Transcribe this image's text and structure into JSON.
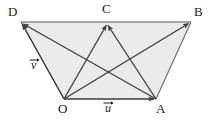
{
  "figure": {
    "type": "vector-geometry-diagram",
    "background_color": "#ffffff",
    "fill_color": "#ebebeb",
    "stroke_color": "#4a4a4a",
    "label_color": "#1a1a1a",
    "width": 211,
    "height": 121,
    "points": {
      "D": {
        "label": "D",
        "x": 21,
        "y": 22,
        "label_x": 8,
        "label_y": 6
      },
      "C": {
        "label": "C",
        "x": 107,
        "y": 23,
        "label_x": 103,
        "label_y": 3
      },
      "B": {
        "label": "B",
        "x": 191,
        "y": 22,
        "label_x": 195,
        "label_y": 6
      },
      "O": {
        "label": "O",
        "x": 64,
        "y": 99,
        "label_x": 59,
        "label_y": 103
      },
      "A": {
        "label": "A",
        "x": 156,
        "y": 99,
        "label_x": 156,
        "label_y": 103
      }
    },
    "polygon": {
      "name": "trapezoid-DBAO",
      "vertices": "D,B,A,O",
      "path": "21,22 191,22 156,99 64,99"
    },
    "vectors": [
      {
        "name": "O-to-A",
        "from": "O",
        "to": "A",
        "label": "u"
      },
      {
        "name": "O-to-D",
        "from": "O",
        "to": "D",
        "label": "v"
      },
      {
        "name": "O-to-C",
        "from": "O",
        "to": "C",
        "label": ""
      },
      {
        "name": "O-to-B",
        "from": "O",
        "to": "B",
        "label": ""
      },
      {
        "name": "A-to-D",
        "from": "A",
        "to": "D",
        "label": ""
      },
      {
        "name": "A-to-C",
        "from": "A",
        "to": "C",
        "label": ""
      }
    ],
    "vector_labels": {
      "u": {
        "text": "u",
        "x": 105,
        "y": 103
      },
      "v": {
        "text": "v",
        "x": 31,
        "y": 60
      }
    },
    "edges": [
      {
        "name": "edge-D-B",
        "from": "D",
        "to": "B"
      },
      {
        "name": "edge-B-A",
        "from": "B",
        "to": "A"
      },
      {
        "name": "edge-A-O",
        "from": "A",
        "to": "O"
      },
      {
        "name": "edge-O-D",
        "from": "O",
        "to": "D"
      }
    ]
  }
}
